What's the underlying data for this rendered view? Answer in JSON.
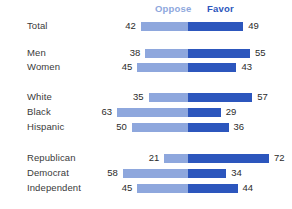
{
  "chart_data": {
    "type": "bar",
    "subtype": "diverging-stacked-bar",
    "title": "",
    "xlabel": "",
    "ylabel": "",
    "legend": [
      {
        "name": "Oppose",
        "color": "#8ea7dd"
      },
      {
        "name": "Favor",
        "color": "#2c56bd"
      }
    ],
    "legend_position": "top",
    "grid": false,
    "axis_center_label": "0",
    "units": "percent",
    "categories": [
      "Total",
      "Men",
      "Women",
      "White",
      "Black",
      "Hispanic",
      "Republican",
      "Democrat",
      "Independent"
    ],
    "series": [
      {
        "name": "Oppose",
        "values": [
          42,
          38,
          45,
          35,
          63,
          50,
          21,
          58,
          45
        ]
      },
      {
        "name": "Favor",
        "values": [
          49,
          55,
          43,
          57,
          29,
          36,
          72,
          34,
          44
        ]
      }
    ],
    "groups": [
      {
        "name": "overall",
        "categories": [
          "Total"
        ]
      },
      {
        "name": "gender",
        "categories": [
          "Men",
          "Women"
        ]
      },
      {
        "name": "race",
        "categories": [
          "White",
          "Black",
          "Hispanic"
        ]
      },
      {
        "name": "party",
        "categories": [
          "Republican",
          "Democrat",
          "Independent"
        ]
      }
    ]
  },
  "legend": {
    "oppose": "Oppose",
    "favor": "Favor"
  },
  "rows": [
    {
      "label": "Total",
      "oppose": 42,
      "favor": 49,
      "oppose_text": "42",
      "favor_text": "49",
      "top": 19
    },
    {
      "label": "Men",
      "oppose": 38,
      "favor": 55,
      "oppose_text": "38",
      "favor_text": "55",
      "top": 46
    },
    {
      "label": "Women",
      "oppose": 45,
      "favor": 43,
      "oppose_text": "45",
      "favor_text": "43",
      "top": 60
    },
    {
      "label": "White",
      "oppose": 35,
      "favor": 57,
      "oppose_text": "35",
      "favor_text": "57",
      "top": 90
    },
    {
      "label": "Black",
      "oppose": 63,
      "favor": 29,
      "oppose_text": "63",
      "favor_text": "29",
      "top": 105
    },
    {
      "label": "Hispanic",
      "oppose": 50,
      "favor": 36,
      "oppose_text": "50",
      "favor_text": "36",
      "top": 120
    },
    {
      "label": "Republican",
      "oppose": 21,
      "favor": 72,
      "oppose_text": "21",
      "favor_text": "72",
      "top": 151
    },
    {
      "label": "Democrat",
      "oppose": 58,
      "favor": 34,
      "oppose_text": "58",
      "favor_text": "34",
      "top": 166
    },
    {
      "label": "Independent",
      "oppose": 45,
      "favor": 44,
      "oppose_text": "45",
      "favor_text": "44",
      "top": 181
    }
  ],
  "colors": {
    "oppose": "#8ea7dd",
    "favor": "#2c56bd",
    "label_text": "#3a3a3a",
    "value_text": "#2b2b2b",
    "background": "#ffffff"
  },
  "layout": {
    "center_x": 188,
    "px_per_unit": 1.125,
    "value_gap": 5
  }
}
